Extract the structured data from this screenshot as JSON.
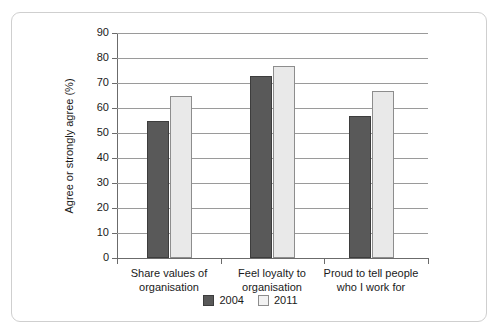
{
  "chart_data": {
    "type": "bar",
    "title": "",
    "subtitle": "",
    "xlabel": "",
    "ylabel": "Agree or strongly agree (%)",
    "categories": [
      "Share values of organisation",
      "Feel loyalty to organisation",
      "Proud to tell people who I work for"
    ],
    "category_lines": [
      [
        "Share values of",
        "organisation"
      ],
      [
        "Feel loyalty to",
        "organisation"
      ],
      [
        "Proud to tell people",
        "who I work for"
      ]
    ],
    "series": [
      {
        "name": "2004",
        "color": "#595959",
        "values": [
          55,
          73,
          57
        ]
      },
      {
        "name": "2011",
        "color": "#e9e9e9",
        "values": [
          65,
          77,
          67
        ]
      }
    ],
    "ylim": [
      0,
      90
    ],
    "ytick_step": 10,
    "ytick_labels": [
      "0",
      "10",
      "20",
      "30",
      "40",
      "50",
      "60",
      "70",
      "80",
      "90"
    ],
    "grid": true,
    "grid_axis": "y",
    "legend_position": "bottom-center",
    "legend": [
      "2004",
      "2011"
    ]
  },
  "frame": {
    "border_color": "#cfcfcf",
    "background": "#ffffff"
  }
}
